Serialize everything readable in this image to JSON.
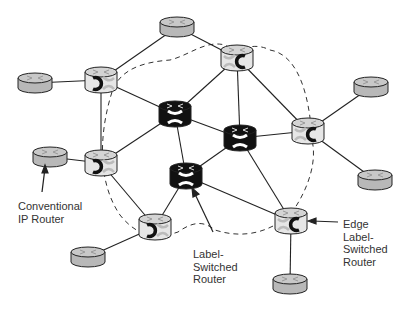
{
  "diagram": {
    "labels": {
      "conventional": [
        "Conventional",
        "IP Router"
      ],
      "lsr": [
        "Label-",
        "Switched",
        "Router"
      ],
      "edge": [
        "Edge",
        "Label-",
        "Switched",
        "Router"
      ]
    },
    "nodes": [
      {
        "id": "g_top",
        "type": "conventional",
        "x": 177,
        "y": 27
      },
      {
        "id": "g_left",
        "type": "conventional",
        "x": 35,
        "y": 83
      },
      {
        "id": "g_left2",
        "type": "conventional",
        "x": 50,
        "y": 157
      },
      {
        "id": "g_botleft",
        "type": "conventional",
        "x": 88,
        "y": 257
      },
      {
        "id": "g_bottom",
        "type": "conventional",
        "x": 290,
        "y": 284
      },
      {
        "id": "g_right",
        "type": "conventional",
        "x": 371,
        "y": 87
      },
      {
        "id": "g_right2",
        "type": "conventional",
        "x": 375,
        "y": 180
      },
      {
        "id": "e_tl",
        "type": "edge",
        "x": 101,
        "y": 80,
        "flip": false
      },
      {
        "id": "e_tr",
        "type": "edge",
        "x": 237,
        "y": 58,
        "flip": true
      },
      {
        "id": "e_ml",
        "type": "edge",
        "x": 101,
        "y": 163,
        "flip": false
      },
      {
        "id": "e_r",
        "type": "edge",
        "x": 308,
        "y": 131,
        "flip": true
      },
      {
        "id": "e_b",
        "type": "edge",
        "x": 155,
        "y": 227,
        "flip": false
      },
      {
        "id": "e_br",
        "type": "edge",
        "x": 291,
        "y": 221,
        "flip": true
      },
      {
        "id": "c1",
        "type": "core",
        "x": 175,
        "y": 114
      },
      {
        "id": "c2",
        "type": "core",
        "x": 240,
        "y": 138
      },
      {
        "id": "c3",
        "type": "core",
        "x": 186,
        "y": 176
      }
    ],
    "links": [
      [
        "g_top",
        "e_tl"
      ],
      [
        "g_top",
        "e_tr"
      ],
      [
        "g_left",
        "e_tl"
      ],
      [
        "g_left2",
        "e_ml"
      ],
      [
        "g_botleft",
        "e_b"
      ],
      [
        "g_bottom",
        "e_br"
      ],
      [
        "g_right",
        "e_r"
      ],
      [
        "g_right2",
        "e_r"
      ],
      [
        "e_tl",
        "e_ml"
      ],
      [
        "e_tl",
        "c1"
      ],
      [
        "e_tr",
        "c1"
      ],
      [
        "e_tr",
        "c2"
      ],
      [
        "e_tr",
        "e_r"
      ],
      [
        "e_ml",
        "c1"
      ],
      [
        "e_ml",
        "e_b"
      ],
      [
        "e_b",
        "c3"
      ],
      [
        "c1",
        "c2"
      ],
      [
        "c1",
        "c3"
      ],
      [
        "c2",
        "c3"
      ],
      [
        "c2",
        "e_r"
      ],
      [
        "c2",
        "e_br"
      ],
      [
        "c3",
        "e_br"
      ]
    ],
    "colors": {
      "conventional": "#b8b8b8",
      "edge": "#e6e6e6",
      "core": "#111111",
      "line": "#222222"
    }
  }
}
